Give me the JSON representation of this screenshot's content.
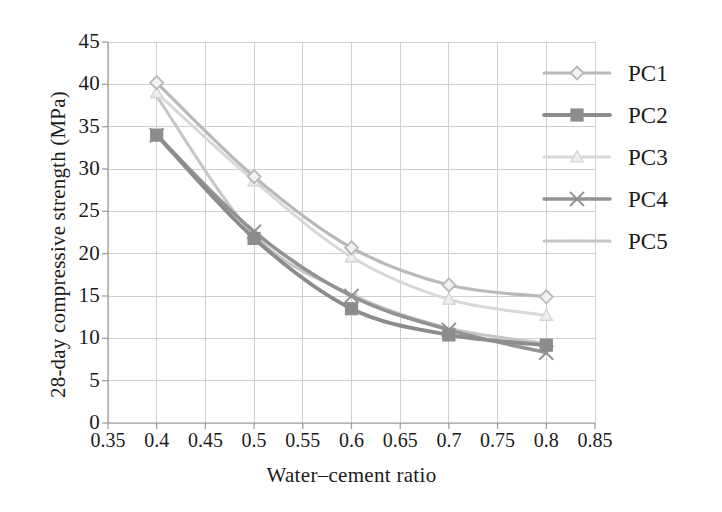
{
  "chart_data": {
    "type": "line",
    "title": "",
    "xlabel": "Water–cement ratio",
    "ylabel": "28-day compressive strength (MPa)",
    "x": [
      0.4,
      0.5,
      0.6,
      0.7,
      0.8
    ],
    "xlim": [
      0.35,
      0.85
    ],
    "ylim": [
      0,
      45
    ],
    "xticks": [
      "0.35",
      "0.4",
      "0.45",
      "0.5",
      "0.55",
      "0.6",
      "0.65",
      "0.7",
      "0.75",
      "0.8",
      "0.85"
    ],
    "xtick_values": [
      0.35,
      0.4,
      0.45,
      0.5,
      0.55,
      0.6,
      0.65,
      0.7,
      0.75,
      0.8,
      0.85
    ],
    "yticks": [
      "0",
      "5",
      "10",
      "15",
      "20",
      "25",
      "30",
      "35",
      "40",
      "45"
    ],
    "ytick_values": [
      0,
      5,
      10,
      15,
      20,
      25,
      30,
      35,
      40,
      45
    ],
    "grid": true,
    "legend_position": "upper right",
    "series": [
      {
        "name": "PC1",
        "values": [
          40.2,
          29.1,
          20.7,
          16.3,
          14.9
        ],
        "color": "#b9b9b9",
        "marker": "diamond",
        "linewidth": 3.2
      },
      {
        "name": "PC2",
        "values": [
          34.0,
          21.8,
          13.5,
          10.4,
          9.2
        ],
        "color": "#8c8c8c",
        "marker": "square",
        "linewidth": 3.8
      },
      {
        "name": "PC3",
        "values": [
          39.0,
          28.6,
          19.6,
          14.6,
          12.7
        ],
        "color": "#d8d8d8",
        "marker": "triangle",
        "linewidth": 3.0
      },
      {
        "name": "PC4",
        "values": [
          34.0,
          22.6,
          15.0,
          11.0,
          8.3
        ],
        "color": "#939393",
        "marker": "cross",
        "linewidth": 3.6
      },
      {
        "name": "PC5",
        "values": [
          38.6,
          22.2,
          15.2,
          11.2,
          9.4
        ],
        "color": "#c6c6c6",
        "marker": "dash",
        "linewidth": 3.0
      }
    ]
  },
  "axes": {
    "x_label": "Water–cement ratio",
    "y_label": "28-day compressive strength (MPa)"
  },
  "legend": {
    "items": [
      {
        "label": "PC1"
      },
      {
        "label": "PC2"
      },
      {
        "label": "PC3"
      },
      {
        "label": "PC4"
      },
      {
        "label": "PC5"
      }
    ]
  },
  "colors": {
    "grid": "#cfcfcf",
    "axis": "#9a9a9a",
    "text": "#1b1b1b",
    "background": "#ffffff"
  }
}
